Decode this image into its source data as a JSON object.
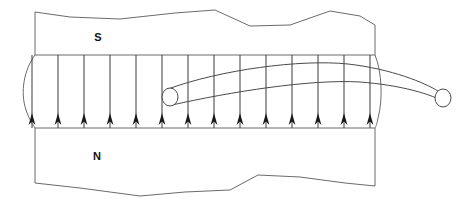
{
  "figure": {
    "background_color": "#ffffff",
    "width": 471,
    "height": 207,
    "labels": {
      "south_pole": "S",
      "north_pole": "N"
    },
    "colors": {
      "outline": "#6b6b6b",
      "field_line": "#3a3a3a",
      "arrowhead": "#1a1a1a",
      "wire_stroke": "#4a4a4a",
      "wire_fill": "#ffffff",
      "label_text": "#111111"
    }
  },
  "chart_data": {
    "type": "diagram",
    "field_direction": "up",
    "field_line_count": 14,
    "field_line_x": [
      32,
      58,
      84,
      110,
      136,
      162,
      188,
      214,
      240,
      266,
      292,
      318,
      344,
      370
    ],
    "gap_top_y": 55,
    "gap_bottom_y": 128,
    "arrow_tip_y": 113,
    "poles": [
      {
        "label": "S",
        "position": "top",
        "x": 98,
        "y": 38
      },
      {
        "label": "N",
        "position": "bottom",
        "x": 97,
        "y": 157
      }
    ],
    "conductor": {
      "left_end": {
        "cx": 170,
        "cy": 97,
        "rx": 8,
        "ry": 9
      },
      "right_end": {
        "cx": 443,
        "cy": 98,
        "rx": 8,
        "ry": 9
      },
      "shape": "cylinder arcing upward through the gap"
    }
  },
  "geometry": {
    "top_block_path": "M 35 12 L 70 17 L 120 19 L 175 13 L 215 10 L 250 26 L 290 25 L 330 11 L 360 16 L 375 25 L 375 55 L 35 55 Z",
    "bottom_block_path": "M 35 128 L 375 128 L 375 186 L 345 183 L 300 177 L 258 175 L 230 190 L 185 192 L 140 196 L 80 188 L 35 183 Z",
    "gap_left_edge": "M 35 55 C 24 70, 20 92, 26 110 C 29 119, 33 125, 35 128",
    "gap_right_edge": "M 375 55 C 382 72, 383 100, 378 118 C 377 124, 376 126, 375 128",
    "wire_top_edge": "M 168 89 C 220 70, 300 59, 348 64 C 392 69, 425 83, 438 91",
    "wire_bottom_edge": "M 172 105 C 230 92, 310 79, 360 82 C 400 85, 432 94, 446 103"
  }
}
